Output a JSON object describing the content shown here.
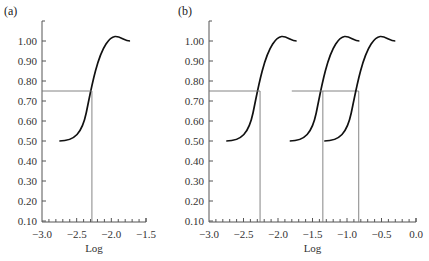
{
  "chart_data": [
    {
      "panel_label": "(a)",
      "type": "line",
      "xlabel": "Log",
      "ylabel": "",
      "xlim": [
        -3.0,
        -1.5
      ],
      "ylim": [
        0.1,
        1.05
      ],
      "x_ticks": [
        "-3.0",
        "-2.5",
        "-2.0",
        "-1.5"
      ],
      "y_ticks": [
        "0.10",
        "0.20",
        "0.30",
        "0.40",
        "0.50",
        "0.60",
        "0.70",
        "0.80",
        "0.90",
        "1.00"
      ],
      "grid": false,
      "reference_level": 0.75,
      "series": [
        {
          "name": "curve-1",
          "x_start": -2.75,
          "x_end": -1.73,
          "y_start": 0.5,
          "y_end": 1.0,
          "midpoint_x": -2.28,
          "crossing_x_at_075": -2.28
        }
      ]
    },
    {
      "panel_label": "(b)",
      "type": "line",
      "xlabel": "Log",
      "ylabel": "",
      "xlim": [
        -3.0,
        0.0
      ],
      "ylim": [
        0.1,
        1.05
      ],
      "x_ticks": [
        "-3.0",
        "-2.5",
        "-2.0",
        "-1.5",
        "-1.0",
        "-0.5",
        "0.0"
      ],
      "y_ticks": [
        "0.10",
        "0.20",
        "0.30",
        "0.40",
        "0.50",
        "0.60",
        "0.70",
        "0.80",
        "0.90",
        "1.00"
      ],
      "grid": false,
      "reference_level": 0.75,
      "series": [
        {
          "name": "curve-1",
          "x_start": -2.75,
          "x_end": -1.73,
          "y_start": 0.5,
          "y_end": 1.0,
          "crossing_x_at_075": -2.26
        },
        {
          "name": "curve-2",
          "x_start": -1.83,
          "x_end": -0.82,
          "y_start": 0.5,
          "y_end": 1.0,
          "crossing_x_at_075": -1.35
        },
        {
          "name": "curve-3",
          "x_start": -1.33,
          "x_end": -0.3,
          "y_start": 0.5,
          "y_end": 1.0,
          "crossing_x_at_075": -0.83
        }
      ]
    }
  ]
}
